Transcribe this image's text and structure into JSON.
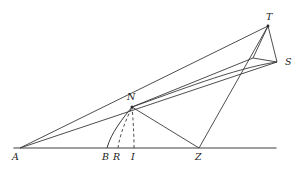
{
  "figure": {
    "kind": "geometric-construction-diagram",
    "background_color": "#ffffff",
    "stroke_color": "#3a3a3a",
    "baseline_color": "#808080",
    "label_color": "#1a1a1a",
    "width": 305,
    "height": 171
  },
  "points": {
    "A": {
      "label": "A",
      "x": 20,
      "y": 148,
      "label_x": 12,
      "label_y": 152
    },
    "B": {
      "label": "B",
      "x": 107,
      "y": 148,
      "label_x": 102,
      "label_y": 152
    },
    "R": {
      "label": "R",
      "x": 118,
      "y": 148,
      "label_x": 113,
      "label_y": 152
    },
    "I": {
      "label": "I",
      "x": 134,
      "y": 148,
      "label_x": 131,
      "label_y": 152
    },
    "Z": {
      "label": "Z",
      "x": 199,
      "y": 148,
      "label_x": 195,
      "label_y": 152
    },
    "N": {
      "label": "N",
      "x": 132,
      "y": 107,
      "label_x": 127,
      "label_y": 92
    },
    "T": {
      "label": "T",
      "x": 268,
      "y": 26,
      "label_x": 266,
      "label_y": 12
    },
    "S": {
      "label": "S",
      "x": 277,
      "y": 62,
      "label_x": 285,
      "label_y": 57
    },
    "V": {
      "label": "",
      "x": 253,
      "y": 58,
      "label_x": 0,
      "label_y": 0
    }
  },
  "baseline": {
    "name": "horizontal-axis",
    "x1": 14,
    "y1": 148,
    "x2": 276,
    "y2": 148
  },
  "segments": [
    {
      "name": "segment-A-to-T",
      "from": "A",
      "to": "T",
      "style": "solid"
    },
    {
      "name": "segment-A-to-S",
      "from": "A",
      "to": "S",
      "style": "solid"
    },
    {
      "name": "segment-N-to-Z",
      "from": "N",
      "to": "Z",
      "style": "solid"
    },
    {
      "name": "segment-Z-to-T",
      "from": "Z",
      "to": "T",
      "style": "solid"
    },
    {
      "name": "segment-T-to-S",
      "from": "T",
      "to": "S",
      "style": "solid"
    },
    {
      "name": "segment-T-to-V",
      "from": "T",
      "to": "V",
      "style": "solid"
    },
    {
      "name": "segment-V-to-S",
      "from": "V",
      "to": "S",
      "style": "solid"
    },
    {
      "name": "segment-N-to-V",
      "from": "N",
      "to": "V",
      "style": "solid"
    }
  ],
  "curves": [
    {
      "name": "arc-B-to-N",
      "style": "solid",
      "path": "M 107 148 C 111 133 123 118 132 107"
    },
    {
      "name": "dashed-arc-R-to-N",
      "style": "dashed",
      "path": "M 118 148 C 120 133 127 118 132 107"
    },
    {
      "name": "dashed-arc-I-to-N",
      "style": "dashed",
      "path": "M 134 148 C 134 133 133 118 132 107"
    },
    {
      "name": "bowed-curve-N-to-S",
      "style": "solid",
      "path": "M 132 107 C 175 92 235 68 277 62"
    }
  ],
  "markers": [
    {
      "name": "vertex-dot-N",
      "x": 132,
      "y": 107
    },
    {
      "name": "vertex-dot-T",
      "x": 268,
      "y": 26
    }
  ]
}
